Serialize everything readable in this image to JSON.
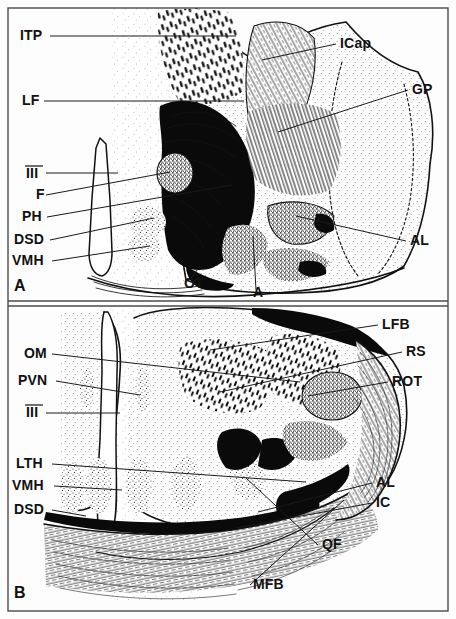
{
  "figure": {
    "panels": [
      {
        "id": "A",
        "panel_label": "A",
        "labels_left": [
          {
            "abbr": "ITP",
            "x": 20,
            "y": 40
          },
          {
            "abbr": "LF",
            "x": 22,
            "y": 105
          },
          {
            "abbr": "III",
            "x": 26,
            "y": 178
          },
          {
            "abbr": "F",
            "x": 36,
            "y": 199
          },
          {
            "abbr": "PH",
            "x": 22,
            "y": 221
          },
          {
            "abbr": "DSD",
            "x": 14,
            "y": 244
          },
          {
            "abbr": "VMH",
            "x": 12,
            "y": 265
          }
        ],
        "labels_right": [
          {
            "abbr": "ICap",
            "x": 340,
            "y": 48
          },
          {
            "abbr": "GP",
            "x": 412,
            "y": 94
          },
          {
            "abbr": "AL",
            "x": 410,
            "y": 245
          }
        ],
        "labels_inline": [
          {
            "abbr": "OT",
            "x": 184,
            "y": 288
          },
          {
            "abbr": "A",
            "x": 253,
            "y": 297
          }
        ]
      },
      {
        "id": "B",
        "panel_label": "B",
        "labels_left": [
          {
            "abbr": "OM",
            "x": 24,
            "y": 358
          },
          {
            "abbr": "PVN",
            "x": 18,
            "y": 385
          },
          {
            "abbr": "III",
            "x": 26,
            "y": 417
          },
          {
            "abbr": "LTH",
            "x": 16,
            "y": 468
          },
          {
            "abbr": "VMH",
            "x": 12,
            "y": 490
          },
          {
            "abbr": "DSD",
            "x": 14,
            "y": 514
          }
        ],
        "labels_right": [
          {
            "abbr": "LFB",
            "x": 382,
            "y": 329
          },
          {
            "abbr": "RS",
            "x": 406,
            "y": 356
          },
          {
            "abbr": "ROT",
            "x": 392,
            "y": 386
          },
          {
            "abbr": "AL",
            "x": 376,
            "y": 487
          },
          {
            "abbr": "IC",
            "x": 376,
            "y": 507
          }
        ],
        "labels_inline": [
          {
            "abbr": "QF",
            "x": 322,
            "y": 549
          },
          {
            "abbr": "MFB",
            "x": 253,
            "y": 589
          }
        ]
      }
    ],
    "abbreviation_glossary": [
      "ITP",
      "LF",
      "III",
      "F",
      "PH",
      "DSD",
      "VMH",
      "OT",
      "A",
      "ICap",
      "GP",
      "AL",
      "OM",
      "PVN",
      "LTH",
      "LFB",
      "RS",
      "ROT",
      "IC",
      "QF",
      "MFB"
    ],
    "colors": {
      "ink": "#0a0a0a",
      "outline": "#111111",
      "frame": "#4a4a4a",
      "background": "#fdfdfd",
      "stipple": "#2b2b2b"
    }
  }
}
